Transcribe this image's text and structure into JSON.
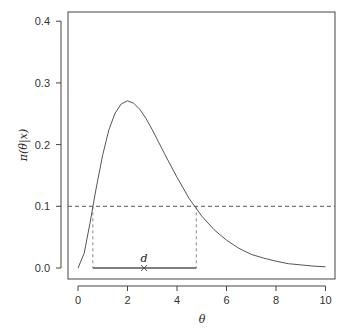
{
  "chart_data": {
    "type": "line",
    "title": "",
    "xlabel": "θ",
    "ylabel": "π(θ|x)",
    "xlim": [
      -0.4,
      10.5
    ],
    "ylim": [
      0.0,
      0.4
    ],
    "x_ticks": [
      0,
      2,
      4,
      6,
      8,
      10
    ],
    "x_tick_labels": [
      "0",
      "2",
      "4",
      "6",
      "8",
      "10"
    ],
    "y_ticks": [
      0.0,
      0.1,
      0.2,
      0.3,
      0.4
    ],
    "y_tick_labels": [
      "0.0",
      "0.1",
      "0.2",
      "0.3",
      "0.4"
    ],
    "grid": false,
    "legend": null,
    "series": [
      {
        "name": "posterior density",
        "x": [
          0,
          0.25,
          0.5,
          0.6,
          0.75,
          1.0,
          1.25,
          1.5,
          1.75,
          2.0,
          2.25,
          2.5,
          2.75,
          3.0,
          3.5,
          4.0,
          4.5,
          4.75,
          5.0,
          5.5,
          6.0,
          6.5,
          7.0,
          7.5,
          8.0,
          8.5,
          9.0,
          9.5,
          10.0
        ],
        "y": [
          0.0,
          0.024,
          0.076,
          0.099,
          0.133,
          0.184,
          0.224,
          0.251,
          0.266,
          0.271,
          0.267,
          0.257,
          0.242,
          0.224,
          0.185,
          0.147,
          0.112,
          0.098,
          0.084,
          0.062,
          0.045,
          0.032,
          0.022,
          0.016,
          0.011,
          0.007,
          0.005,
          0.003,
          0.002
        ],
        "color": "#555555"
      }
    ],
    "annotations": {
      "threshold_line": {
        "y": 0.1,
        "style": "dashed",
        "color": "#555555"
      },
      "hpd_interval": {
        "lower": 0.6,
        "upper": 4.78,
        "y": 0.0,
        "color": "#555555"
      },
      "vertical_dashes": [
        0.6,
        4.78
      ],
      "point_estimate": {
        "x": 2.67,
        "y": 0.0,
        "marker": "x",
        "label": "d"
      }
    }
  }
}
